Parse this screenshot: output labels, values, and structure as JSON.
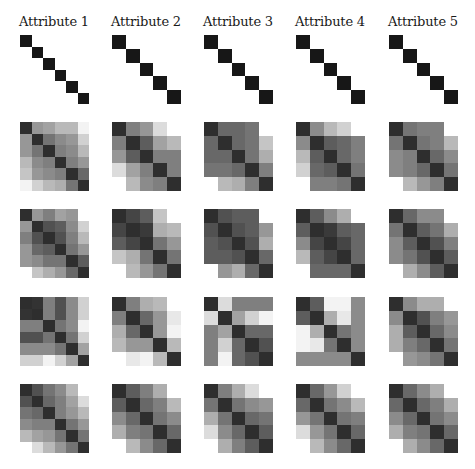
{
  "chart_data": {
    "type": "heatmap",
    "title": "",
    "column_titles": [
      "Attribute 1",
      "Attribute 2",
      "Attribute 3",
      "Attribute 4",
      "Attribute 5"
    ],
    "value_range": [
      0,
      1
    ],
    "colormap": "grayscale (0 = white, 1 = black)",
    "rows": [
      {
        "name": "row-1",
        "matrices": [
          [
            [
              1,
              0,
              0,
              0,
              0,
              0
            ],
            [
              0,
              1,
              0,
              0,
              0,
              0
            ],
            [
              0,
              0,
              1,
              0,
              0,
              0
            ],
            [
              0,
              0,
              0,
              1,
              0,
              0
            ],
            [
              0,
              0,
              0,
              0,
              1,
              0
            ],
            [
              0,
              0,
              0,
              0,
              0,
              1
            ]
          ],
          [
            [
              1,
              0,
              0,
              0,
              0
            ],
            [
              0,
              1,
              0,
              0,
              0
            ],
            [
              0,
              0,
              1,
              0,
              0
            ],
            [
              0,
              0,
              0,
              1,
              0
            ],
            [
              0,
              0,
              0,
              0,
              1
            ]
          ],
          [
            [
              1,
              0,
              0,
              0,
              0
            ],
            [
              0,
              1,
              0,
              0,
              0
            ],
            [
              0,
              0,
              1,
              0,
              0
            ],
            [
              0,
              0,
              0,
              1,
              0
            ],
            [
              0,
              0,
              0,
              0,
              1
            ]
          ],
          [
            [
              1,
              0,
              0,
              0,
              0
            ],
            [
              0,
              1,
              0,
              0,
              0
            ],
            [
              0,
              0,
              1,
              0,
              0
            ],
            [
              0,
              0,
              0,
              1,
              0
            ],
            [
              0,
              0,
              0,
              0,
              1
            ]
          ],
          [
            [
              1,
              0,
              0,
              0,
              0
            ],
            [
              0,
              1,
              0,
              0,
              0
            ],
            [
              0,
              0,
              1,
              0,
              0
            ],
            [
              0,
              0,
              0,
              1,
              0
            ],
            [
              0,
              0,
              0,
              0,
              1
            ]
          ]
        ]
      },
      {
        "name": "row-2",
        "matrices": [
          [
            [
              0.9,
              0.45,
              0.4,
              0.3,
              0.3,
              0.05
            ],
            [
              0.45,
              0.9,
              0.6,
              0.5,
              0.45,
              0.2
            ],
            [
              0.45,
              0.6,
              0.9,
              0.55,
              0.5,
              0.3
            ],
            [
              0.3,
              0.5,
              0.55,
              0.9,
              0.55,
              0.45
            ],
            [
              0.25,
              0.45,
              0.5,
              0.55,
              0.9,
              0.65
            ],
            [
              0.05,
              0.2,
              0.3,
              0.35,
              0.6,
              0.9
            ]
          ],
          [
            [
              0.9,
              0.55,
              0.45,
              0.15,
              0.0
            ],
            [
              0.55,
              0.9,
              0.7,
              0.4,
              0.3
            ],
            [
              0.45,
              0.7,
              0.9,
              0.55,
              0.55
            ],
            [
              0.15,
              0.4,
              0.55,
              0.9,
              0.55
            ],
            [
              0.0,
              0.3,
              0.5,
              0.55,
              0.9
            ]
          ],
          [
            [
              0.9,
              0.65,
              0.65,
              0.6,
              0.0
            ],
            [
              0.65,
              0.9,
              0.65,
              0.6,
              0.25
            ],
            [
              0.65,
              0.65,
              0.9,
              0.6,
              0.35
            ],
            [
              0.6,
              0.6,
              0.65,
              0.9,
              0.55
            ],
            [
              0.0,
              0.3,
              0.35,
              0.55,
              0.9
            ]
          ],
          [
            [
              0.9,
              0.5,
              0.3,
              0.2,
              0.0
            ],
            [
              0.5,
              0.9,
              0.7,
              0.65,
              0.55
            ],
            [
              0.3,
              0.7,
              0.9,
              0.65,
              0.55
            ],
            [
              0.2,
              0.65,
              0.7,
              0.9,
              0.6
            ],
            [
              0.0,
              0.55,
              0.55,
              0.6,
              0.9
            ]
          ],
          [
            [
              0.9,
              0.6,
              0.55,
              0.55,
              0.0
            ],
            [
              0.6,
              0.9,
              0.6,
              0.55,
              0.3
            ],
            [
              0.5,
              0.55,
              0.9,
              0.65,
              0.5
            ],
            [
              0.5,
              0.55,
              0.65,
              0.9,
              0.6
            ],
            [
              0.0,
              0.3,
              0.45,
              0.55,
              0.9
            ]
          ]
        ]
      },
      {
        "name": "row-3",
        "matrices": [
          [
            [
              0.9,
              0.45,
              0.55,
              0.4,
              0.45,
              0.0
            ],
            [
              0.45,
              0.9,
              0.75,
              0.7,
              0.5,
              0.2
            ],
            [
              0.55,
              0.75,
              0.9,
              0.75,
              0.55,
              0.3
            ],
            [
              0.45,
              0.65,
              0.7,
              0.9,
              0.6,
              0.45
            ],
            [
              0.45,
              0.5,
              0.6,
              0.6,
              0.9,
              0.7
            ],
            [
              0.0,
              0.25,
              0.35,
              0.45,
              0.65,
              0.9
            ]
          ],
          [
            [
              0.9,
              0.8,
              0.7,
              0.25,
              0.0
            ],
            [
              0.8,
              0.9,
              0.85,
              0.35,
              0.3
            ],
            [
              0.7,
              0.8,
              0.9,
              0.6,
              0.45
            ],
            [
              0.25,
              0.35,
              0.6,
              0.9,
              0.6
            ],
            [
              0.0,
              0.3,
              0.45,
              0.6,
              0.9
            ]
          ],
          [
            [
              0.9,
              0.75,
              0.7,
              0.7,
              0.0
            ],
            [
              0.75,
              0.9,
              0.75,
              0.7,
              0.45
            ],
            [
              0.7,
              0.75,
              0.9,
              0.75,
              0.35
            ],
            [
              0.7,
              0.7,
              0.75,
              0.9,
              0.65
            ],
            [
              0.0,
              0.45,
              0.35,
              0.65,
              0.9
            ]
          ],
          [
            [
              0.9,
              0.7,
              0.5,
              0.35,
              0.0
            ],
            [
              0.7,
              0.9,
              0.85,
              0.7,
              0.65
            ],
            [
              0.5,
              0.8,
              0.9,
              0.8,
              0.65
            ],
            [
              0.3,
              0.7,
              0.8,
              0.9,
              0.65
            ],
            [
              0.0,
              0.65,
              0.65,
              0.65,
              0.9
            ]
          ],
          [
            [
              0.9,
              0.65,
              0.5,
              0.5,
              0.0
            ],
            [
              0.6,
              0.9,
              0.7,
              0.6,
              0.35
            ],
            [
              0.5,
              0.7,
              0.9,
              0.75,
              0.55
            ],
            [
              0.5,
              0.6,
              0.75,
              0.9,
              0.7
            ],
            [
              0.0,
              0.35,
              0.5,
              0.7,
              0.9
            ]
          ]
        ]
      },
      {
        "name": "row-4",
        "matrices": [
          [
            [
              0.9,
              0.88,
              0.55,
              0.75,
              0.5,
              0.2
            ],
            [
              0.88,
              0.9,
              0.55,
              0.75,
              0.5,
              0.2
            ],
            [
              0.55,
              0.55,
              0.9,
              0.6,
              0.5,
              0.05
            ],
            [
              0.75,
              0.75,
              0.6,
              0.9,
              0.6,
              0.2
            ],
            [
              0.5,
              0.5,
              0.5,
              0.6,
              0.9,
              0.4
            ],
            [
              0.2,
              0.2,
              0.05,
              0.2,
              0.4,
              0.9
            ]
          ],
          [
            [
              0.9,
              0.55,
              0.35,
              0.3,
              0.0
            ],
            [
              0.55,
              0.9,
              0.65,
              0.45,
              0.1
            ],
            [
              0.35,
              0.65,
              0.9,
              0.45,
              0.05
            ],
            [
              0.3,
              0.45,
              0.45,
              0.9,
              0.3
            ],
            [
              0.0,
              0.1,
              0.05,
              0.3,
              0.9
            ]
          ],
          [
            [
              0.9,
              0.15,
              0.55,
              0.55,
              0.55
            ],
            [
              0.15,
              0.9,
              0.4,
              0.2,
              0.05
            ],
            [
              0.55,
              0.4,
              0.9,
              0.65,
              0.65
            ],
            [
              0.55,
              0.2,
              0.65,
              0.9,
              0.75
            ],
            [
              0.55,
              0.05,
              0.65,
              0.75,
              0.9
            ]
          ],
          [
            [
              0.9,
              0.7,
              0.05,
              0.05,
              0.5
            ],
            [
              0.7,
              0.9,
              0.35,
              0.1,
              0.5
            ],
            [
              0.05,
              0.35,
              0.9,
              0.6,
              0.5
            ],
            [
              0.05,
              0.1,
              0.6,
              0.9,
              0.5
            ],
            [
              0.5,
              0.5,
              0.5,
              0.5,
              0.9
            ]
          ],
          [
            [
              0.9,
              0.5,
              0.35,
              0.35,
              0.0
            ],
            [
              0.5,
              0.9,
              0.75,
              0.55,
              0.45
            ],
            [
              0.35,
              0.7,
              0.9,
              0.65,
              0.5
            ],
            [
              0.35,
              0.55,
              0.65,
              0.9,
              0.6
            ],
            [
              0.0,
              0.45,
              0.5,
              0.6,
              0.9
            ]
          ]
        ]
      },
      {
        "name": "row-5",
        "matrices": [
          [
            [
              0.9,
              0.75,
              0.6,
              0.5,
              0.3,
              0.0
            ],
            [
              0.75,
              0.9,
              0.65,
              0.55,
              0.4,
              0.15
            ],
            [
              0.6,
              0.65,
              0.9,
              0.55,
              0.45,
              0.3
            ],
            [
              0.5,
              0.55,
              0.55,
              0.9,
              0.6,
              0.45
            ],
            [
              0.3,
              0.4,
              0.45,
              0.6,
              0.9,
              0.6
            ],
            [
              0.0,
              0.15,
              0.3,
              0.45,
              0.6,
              0.9
            ]
          ],
          [
            [
              0.9,
              0.7,
              0.55,
              0.35,
              0.0
            ],
            [
              0.7,
              0.9,
              0.65,
              0.55,
              0.3
            ],
            [
              0.5,
              0.65,
              0.9,
              0.6,
              0.5
            ],
            [
              0.35,
              0.55,
              0.6,
              0.9,
              0.65
            ],
            [
              0.0,
              0.3,
              0.5,
              0.65,
              0.9
            ]
          ],
          [
            [
              0.9,
              0.55,
              0.35,
              0.15,
              0.0
            ],
            [
              0.6,
              0.9,
              0.6,
              0.5,
              0.45
            ],
            [
              0.35,
              0.6,
              0.9,
              0.65,
              0.6
            ],
            [
              0.15,
              0.5,
              0.65,
              0.9,
              0.7
            ],
            [
              0.0,
              0.35,
              0.55,
              0.7,
              0.9
            ]
          ],
          [
            [
              0.9,
              0.65,
              0.45,
              0.2,
              0.0
            ],
            [
              0.65,
              0.9,
              0.6,
              0.5,
              0.3
            ],
            [
              0.45,
              0.6,
              0.9,
              0.6,
              0.55
            ],
            [
              0.15,
              0.45,
              0.6,
              0.9,
              0.65
            ],
            [
              0.0,
              0.3,
              0.5,
              0.65,
              0.9
            ]
          ],
          [
            [
              0.9,
              0.65,
              0.5,
              0.35,
              0.0
            ],
            [
              0.65,
              0.9,
              0.65,
              0.55,
              0.35
            ],
            [
              0.5,
              0.65,
              0.9,
              0.6,
              0.5
            ],
            [
              0.35,
              0.55,
              0.6,
              0.9,
              0.65
            ],
            [
              0.0,
              0.35,
              0.5,
              0.65,
              0.9
            ]
          ]
        ]
      }
    ]
  },
  "layout": {
    "column_x": [
      20,
      112,
      204,
      296,
      389
    ],
    "row_y": [
      35,
      122,
      209,
      297,
      384
    ],
    "matrix_size": 69
  }
}
